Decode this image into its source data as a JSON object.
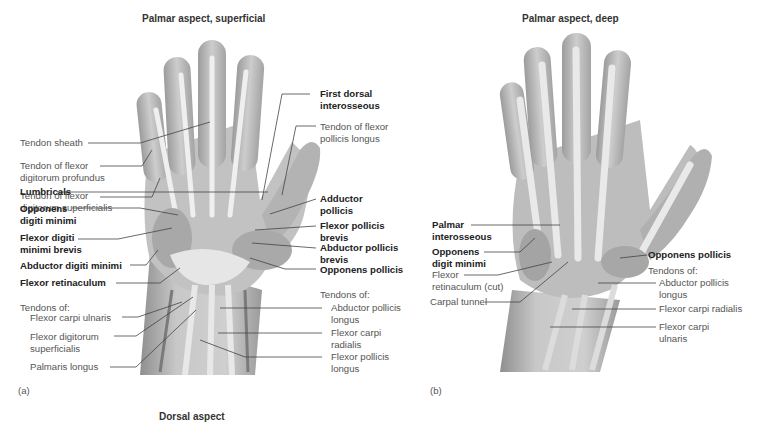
{
  "panels": [
    {
      "id": "a",
      "title": "Palmar aspect, superficial",
      "tag": "(a)",
      "labels_left": [
        {
          "text": "Tendon sheath",
          "bold": false
        },
        {
          "text": "Tendon of flexor\ndigitorum profundus",
          "bold": false
        },
        {
          "text": "Tendon of flexor\ndigitorum superficialis",
          "bold": false
        },
        {
          "text": "Lumbricals",
          "bold": true
        },
        {
          "text": "Opponens\ndigiti minimi",
          "bold": true
        },
        {
          "text": "Flexor digiti\nminimi brevis",
          "bold": true
        },
        {
          "text": "Abductor digiti minimi",
          "bold": true
        },
        {
          "text": "Flexor retinaculum",
          "bold": true
        },
        {
          "text": "Tendons of:",
          "bold": false
        },
        {
          "text": "Flexor carpi ulnaris",
          "bold": false
        },
        {
          "text": "Flexor digitorum\nsuperficialis",
          "bold": false
        },
        {
          "text": "Palmaris longus",
          "bold": false
        }
      ],
      "labels_right": [
        {
          "text": "First dorsal\ninterosseous",
          "bold": true
        },
        {
          "text": "Tendon of flexor\npollicis longus",
          "bold": false
        },
        {
          "text": "Adductor\npollicis",
          "bold": true
        },
        {
          "text": "Flexor pollicis\nbrevis",
          "bold": true
        },
        {
          "text": "Abductor pollicis\nbrevis",
          "bold": true
        },
        {
          "text": "Opponens pollicis",
          "bold": true
        },
        {
          "text": "Tendons of:",
          "bold": false
        },
        {
          "text": "Abductor pollicis\nlongus",
          "bold": false
        },
        {
          "text": "Flexor carpi\nradialis",
          "bold": false
        },
        {
          "text": "Flexor pollicis\nlongus",
          "bold": false
        }
      ]
    },
    {
      "id": "b",
      "title": "Palmar aspect, deep",
      "tag": "(b)",
      "labels_left": [
        {
          "text": "Palmar\ninterosseous",
          "bold": true
        },
        {
          "text": "Opponens\ndigit minimi",
          "bold": true
        },
        {
          "text": "Flexor\nretinaculum (cut)",
          "bold": false
        },
        {
          "text": "Carpal tunnel",
          "bold": false
        }
      ],
      "labels_right": [
        {
          "text": "Opponens pollicis",
          "bold": true
        },
        {
          "text": "Tendons of:",
          "bold": false
        },
        {
          "text": "Abductor pollicis\nlongus",
          "bold": false
        },
        {
          "text": "Flexor carpi radialis",
          "bold": false
        },
        {
          "text": "Flexor carpi\nulnaris",
          "bold": false
        }
      ]
    },
    {
      "id": "c",
      "title": "Dorsal aspect"
    }
  ],
  "colors": {
    "skin": "#b9b9b9",
    "skin_light": "#d4d4d4",
    "tendon": "#eeeeee",
    "muscle": "#a6a6a6",
    "leader": "#444444"
  }
}
